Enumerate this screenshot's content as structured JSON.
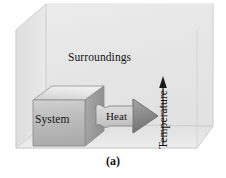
{
  "figure": {
    "caption": "(a)",
    "type": "thermodynamics-system-surroundings-diagram"
  },
  "labels": {
    "surroundings": "Surroundings",
    "system": "System",
    "heat": "Heat",
    "temperature": "Temperature"
  },
  "icons": {
    "heat_arrow": "heat-flow-arrow-right-icon",
    "temperature_arrow": "temperature-increase-arrow-up-icon",
    "system_cube": "system-cube-icon",
    "surroundings_box": "surroundings-open-box-icon"
  },
  "colors": {
    "box_top_face": "#eeeeee",
    "box_back_wall": "#e7e7e7",
    "box_left_wall": "#e2e2e2",
    "box_right_wall": "#e9e9e9",
    "box_floor": "#e4e4e4",
    "box_edge": "#c9c9c9",
    "cube_front_face": "#b9b9b9",
    "cube_top_face": "#dddddd",
    "cube_right_face": "#9e9e9e",
    "cube_outline": "#8f8f8f",
    "arrow_shaft": "#d6d6d6",
    "arrow_head": "#8d8d8d",
    "arrow_outline": "#6f6f6f",
    "temperature_arrow_color": "#1a1a1a",
    "text": "#141414",
    "background": "#ffffff"
  },
  "geometry": {
    "front_rect": [
      16,
      30,
      197,
      148
    ],
    "depth_offset_x": 30,
    "depth_offset_y": -26,
    "cube_front": [
      33,
      100,
      85,
      146
    ],
    "heat_arrow_span": [
      96,
      158
    ],
    "temperature_arrow": [
      163,
      78,
      163,
      146
    ]
  }
}
